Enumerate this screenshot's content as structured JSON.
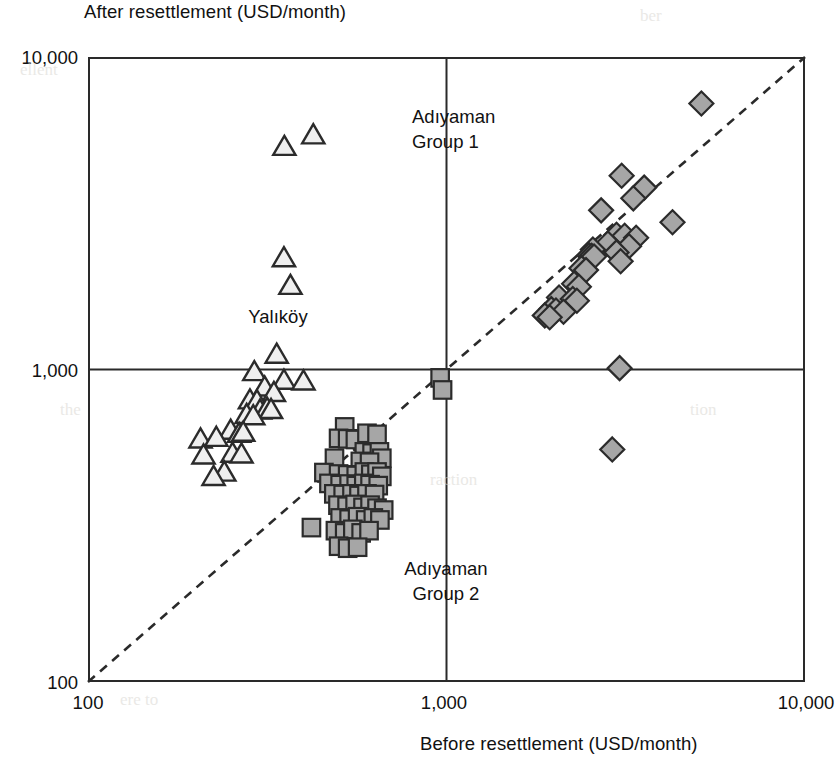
{
  "axes": {
    "y_title": "After resettlement (USD/month)",
    "x_title": "Before resettlement (USD/month)",
    "y_ticks": [
      "10,000",
      "1,000",
      "100"
    ],
    "x_ticks": [
      "100",
      "1,000",
      "10,000"
    ]
  },
  "annotations": {
    "group1": "Adıyaman\nGroup 1",
    "group2": "Adıyaman\nGroup 2",
    "yalikoy": "Yalıköy"
  },
  "colors": {
    "marker_fill": "#a6a6a6",
    "marker_stroke": "#2b2b2b",
    "axis": "#2a2a2a",
    "gridline": "#2a2a2a",
    "diagonal": "#2a2a2a",
    "text": "#111111",
    "background": "#ffffff"
  },
  "chart_data": {
    "type": "scatter",
    "title": "",
    "xlabel": "Before resettlement (USD/month)",
    "ylabel": "After resettlement (USD/month)",
    "xscale": "log",
    "yscale": "log",
    "xlim": [
      100,
      10000
    ],
    "ylim": [
      100,
      10000
    ],
    "grid": true,
    "gridlines": {
      "x": [
        1000
      ],
      "y": [
        1000
      ]
    },
    "reference_line": {
      "label": "1:1 parity line (y = x)",
      "style": "dashed",
      "from": [
        100,
        100
      ],
      "to": [
        10000,
        10000
      ]
    },
    "legend_position": "in-plot annotations",
    "series": [
      {
        "name": "Yalıköy",
        "marker": "triangle",
        "points": [
          [
            353,
            5180
          ],
          [
            425,
            5640
          ],
          [
            352,
            2280
          ],
          [
            367,
            1860
          ],
          [
            336,
            1120
          ],
          [
            291,
            985
          ],
          [
            352,
            925
          ],
          [
            399,
            920
          ],
          [
            311,
            880
          ],
          [
            330,
            845
          ],
          [
            283,
            800
          ],
          [
            296,
            795
          ],
          [
            302,
            742
          ],
          [
            316,
            752
          ],
          [
            324,
            745
          ],
          [
            277,
            718
          ],
          [
            289,
            712
          ],
          [
            250,
            640
          ],
          [
            264,
            625
          ],
          [
            271,
            630
          ],
          [
            206,
            600
          ],
          [
            228,
            607
          ],
          [
            210,
            533
          ],
          [
            253,
            540
          ],
          [
            268,
            537
          ],
          [
            240,
            470
          ],
          [
            224,
            455
          ]
        ]
      },
      {
        "name": "Adıyaman Group 2",
        "marker": "square",
        "points": [
          [
            960,
            940
          ],
          [
            975,
            860
          ],
          [
            520,
            655
          ],
          [
            500,
            602
          ],
          [
            530,
            600
          ],
          [
            557,
            597
          ],
          [
            600,
            625
          ],
          [
            640,
            620
          ],
          [
            487,
            520
          ],
          [
            590,
            545
          ],
          [
            620,
            540
          ],
          [
            650,
            545
          ],
          [
            660,
            520
          ],
          [
            575,
            508
          ],
          [
            610,
            505
          ],
          [
            455,
            468
          ],
          [
            500,
            463
          ],
          [
            530,
            460
          ],
          [
            560,
            458
          ],
          [
            590,
            470
          ],
          [
            615,
            462
          ],
          [
            640,
            470
          ],
          [
            660,
            455
          ],
          [
            470,
            432
          ],
          [
            505,
            428
          ],
          [
            535,
            430
          ],
          [
            560,
            425
          ],
          [
            588,
            432
          ],
          [
            612,
            428
          ],
          [
            645,
            425
          ],
          [
            485,
            400
          ],
          [
            515,
            398
          ],
          [
            545,
            400
          ],
          [
            570,
            395
          ],
          [
            600,
            400
          ],
          [
            630,
            398
          ],
          [
            498,
            368
          ],
          [
            528,
            365
          ],
          [
            556,
            370
          ],
          [
            585,
            362
          ],
          [
            612,
            368
          ],
          [
            640,
            360
          ],
          [
            668,
            355
          ],
          [
            505,
            335
          ],
          [
            535,
            332
          ],
          [
            565,
            338
          ],
          [
            595,
            330
          ],
          [
            625,
            335
          ],
          [
            652,
            330
          ],
          [
            420,
            312
          ],
          [
            490,
            305
          ],
          [
            520,
            300
          ],
          [
            548,
            308
          ],
          [
            578,
            300
          ],
          [
            608,
            305
          ],
          [
            500,
            272
          ],
          [
            530,
            268
          ],
          [
            565,
            270
          ]
        ]
      },
      {
        "name": "Adıyaman Group 1",
        "marker": "diamond",
        "points": [
          [
            5140,
            7100
          ],
          [
            3080,
            4170
          ],
          [
            3560,
            3820
          ],
          [
            3320,
            3530
          ],
          [
            2700,
            3230
          ],
          [
            4270,
            2960
          ],
          [
            2980,
            2700
          ],
          [
            3140,
            2680
          ],
          [
            3380,
            2640
          ],
          [
            2820,
            2530
          ],
          [
            3230,
            2480
          ],
          [
            2560,
            2420
          ],
          [
            2980,
            2370
          ],
          [
            2500,
            2320
          ],
          [
            2540,
            2310
          ],
          [
            2580,
            2300
          ],
          [
            3060,
            2220
          ],
          [
            2380,
            2110
          ],
          [
            2450,
            2080
          ],
          [
            2270,
            1880
          ],
          [
            2340,
            1840
          ],
          [
            2060,
            1700
          ],
          [
            2250,
            1680
          ],
          [
            2310,
            1660
          ],
          [
            1960,
            1560
          ],
          [
            2020,
            1545
          ],
          [
            2120,
            1530
          ],
          [
            1880,
            1490
          ],
          [
            1940,
            1470
          ],
          [
            3040,
            1010
          ],
          [
            2900,
            555
          ]
        ]
      }
    ]
  },
  "background_artifacts": [
    "ber",
    "ellent",
    "raction",
    "ere to",
    "tion",
    "the"
  ]
}
